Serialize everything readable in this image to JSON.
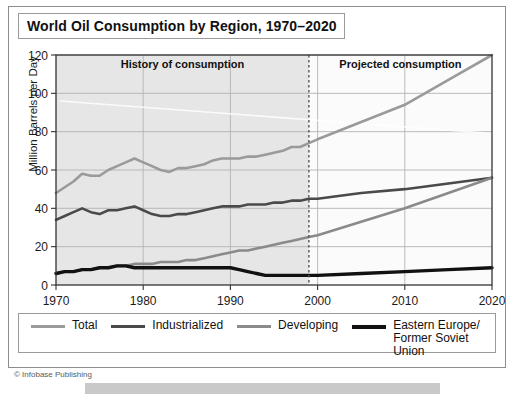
{
  "header": {
    "title": "World Oil Consumption by Region, 1970–2020"
  },
  "credit": "© Infobase Publishing",
  "annotations": {
    "history": "History of consumption",
    "projected": "Projected consumption",
    "divider_year": 1999
  },
  "legend": {
    "items": [
      {
        "label": "Total",
        "color": "#9a9a9a",
        "thick": false
      },
      {
        "label": "Industrialized",
        "color": "#4a4a4a",
        "thick": false
      },
      {
        "label": "Developing",
        "color": "#8a8a8a",
        "thick": false
      },
      {
        "label": "Eastern Europe/\nFormer Soviet Union",
        "color": "#111111",
        "thick": true
      }
    ]
  },
  "chart_data": {
    "type": "line",
    "title": "World Oil Consumption by Region, 1970–2020",
    "xlabel": "",
    "ylabel": "Million Barrels per Day",
    "xlim": [
      1970,
      2020
    ],
    "ylim": [
      0,
      120
    ],
    "yticks": [
      0,
      20,
      40,
      60,
      80,
      100,
      120
    ],
    "xticks": [
      1970,
      1980,
      1990,
      2000,
      2010,
      2020
    ],
    "grid": true,
    "legend_position": "below",
    "shaded_region": {
      "label": "History of consumption",
      "x_from": 1970,
      "x_to": 1999
    },
    "x": [
      1970,
      1971,
      1972,
      1973,
      1974,
      1975,
      1976,
      1977,
      1978,
      1979,
      1980,
      1981,
      1982,
      1983,
      1984,
      1985,
      1986,
      1987,
      1988,
      1989,
      1990,
      1991,
      1992,
      1993,
      1994,
      1995,
      1996,
      1997,
      1998,
      1999,
      2000,
      2005,
      2010,
      2015,
      2020
    ],
    "series": [
      {
        "name": "Total",
        "color": "#9a9a9a",
        "width": 2.6,
        "values": [
          48,
          51,
          54,
          58,
          57,
          57,
          60,
          62,
          64,
          66,
          64,
          62,
          60,
          59,
          61,
          61,
          62,
          63,
          65,
          66,
          66,
          66,
          67,
          67,
          68,
          69,
          70,
          72,
          72,
          74,
          76,
          85,
          94,
          107,
          120
        ]
      },
      {
        "name": "Industrialized",
        "color": "#4a4a4a",
        "width": 2.6,
        "values": [
          34,
          36,
          38,
          40,
          38,
          37,
          39,
          39,
          40,
          41,
          39,
          37,
          36,
          36,
          37,
          37,
          38,
          39,
          40,
          41,
          41,
          41,
          42,
          42,
          42,
          43,
          43,
          44,
          44,
          45,
          45,
          48,
          50,
          53,
          56
        ]
      },
      {
        "name": "Developing",
        "color": "#8a8a8a",
        "width": 2.6,
        "values": [
          6,
          7,
          7,
          8,
          8,
          9,
          9,
          10,
          10,
          11,
          11,
          11,
          12,
          12,
          12,
          13,
          13,
          14,
          15,
          16,
          17,
          18,
          18,
          19,
          20,
          21,
          22,
          23,
          24,
          25,
          26,
          33,
          40,
          48,
          56
        ]
      },
      {
        "name": "Eastern Europe/Former Soviet Union",
        "color": "#111111",
        "width": 3.4,
        "values": [
          6,
          7,
          7,
          8,
          8,
          9,
          9,
          10,
          10,
          9,
          9,
          9,
          9,
          9,
          9,
          9,
          9,
          9,
          9,
          9,
          9,
          8,
          7,
          6,
          5,
          5,
          5,
          5,
          5,
          5,
          5,
          6,
          7,
          8,
          9
        ]
      }
    ]
  }
}
